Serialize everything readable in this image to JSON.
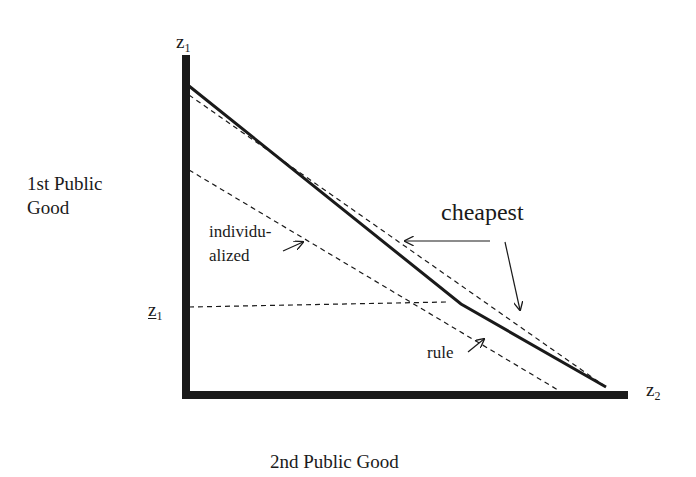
{
  "axes": {
    "y_axis_label": "1st Public Good",
    "x_axis_label": "2nd Public Good",
    "y_axis_end_symbol": "z",
    "y_axis_end_subscript": "1",
    "x_axis_end_symbol": "z",
    "x_axis_end_subscript": "2",
    "y_marker_symbol": "z",
    "y_marker_subscript": "1",
    "y_marker_note": "underlined z1 (lower bound)"
  },
  "annotations": {
    "cheapest": "cheapest",
    "individualized_line1": "individu-",
    "individualized_line2": "alized",
    "rule": "rule"
  },
  "lines": [
    {
      "name": "cheapest-frontier",
      "style": "solid",
      "points": [
        [
          189,
          86
        ],
        [
          461,
          304
        ],
        [
          606,
          387
        ]
      ]
    },
    {
      "name": "individualized-line",
      "style": "dashed",
      "points": [
        [
          189,
          95
        ],
        [
          606,
          387
        ]
      ]
    },
    {
      "name": "rule-line",
      "style": "dashed",
      "points": [
        [
          189,
          170
        ],
        [
          558,
          390
        ]
      ]
    },
    {
      "name": "z1-lower-bound",
      "style": "dashed",
      "points": [
        [
          189,
          307
        ],
        [
          447,
          302
        ]
      ]
    }
  ],
  "colors": {
    "ink": "#1a1a1a",
    "background": "#ffffff"
  }
}
